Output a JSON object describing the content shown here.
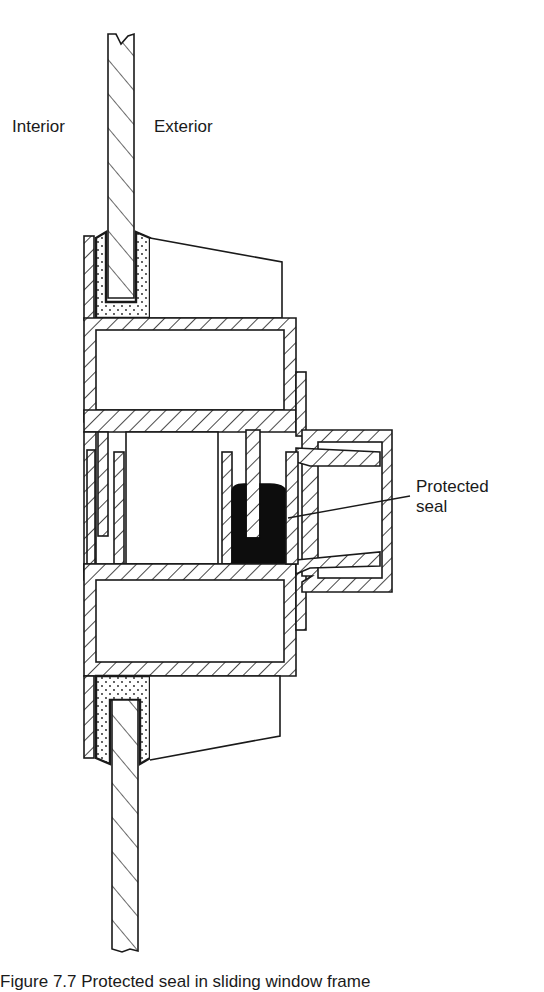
{
  "figure": {
    "labels": {
      "interior": "Interior",
      "exterior": "Exterior",
      "seal_line1": "Protected",
      "seal_line2": "seal"
    },
    "caption": "Figure 7.7 Protected seal in sliding window frame",
    "colors": {
      "ink": "#1a1a1a",
      "background": "#ffffff",
      "seal_fill": "#0d0d0d"
    },
    "components": [
      "glass-pane-upper",
      "glazing-bead-upper",
      "glazing-compound-upper",
      "frame-box-upper",
      "frame-box-lower",
      "sliding-sash-track",
      "exterior-weather-box",
      "protected-seal",
      "glazing-compound-lower",
      "glazing-bead-lower",
      "glass-pane-lower"
    ]
  }
}
